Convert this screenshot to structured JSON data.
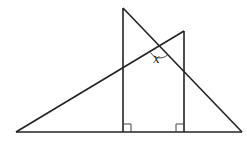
{
  "diagram": {
    "type": "geometry",
    "stroke_color": "#222222",
    "angle_label": "x",
    "right_angle_markers": 2,
    "points": {
      "baseline_left": [
        16,
        132
      ],
      "baseline_right": [
        242,
        132
      ],
      "left_vertical_top": [
        123,
        8
      ],
      "left_vertical_foot": [
        123,
        132
      ],
      "right_vertical_top": [
        184,
        31
      ],
      "right_vertical_foot": [
        184,
        132
      ],
      "hypotenuse_intersection": [
        160,
        47
      ]
    }
  }
}
